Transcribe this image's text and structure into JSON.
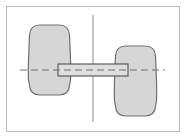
{
  "figure": {
    "title": "Two-mass rotor on a shaft, elevation view",
    "type": "technical-line-diagram",
    "background_color": "#ffffff",
    "frame": {
      "name": "figure-border",
      "stroke_color": "#b9b9b9",
      "stroke_width": 1,
      "x": 6,
      "y": 6,
      "width": 174,
      "height": 126
    },
    "style": {
      "body_fill_color": "#d6d6d6",
      "body_stroke_color": "#6e6e6e",
      "body_stroke_width": 1.2,
      "shaft_fill_color": "#dedede",
      "shaft_stroke_color": "#5c5c5c",
      "shaft_stroke_width": 1.2,
      "centerline_color": "#6e6e6e",
      "axis_line_color": "#8a8a8a",
      "dash_pattern": "7 4"
    },
    "shapes": [
      {
        "name": "left-mass-body",
        "kind": "rounded-barrel",
        "x": 30,
        "y": 25,
        "width": 39,
        "height": 70,
        "corner_radius": 10,
        "bulge": 4,
        "fill": "#d6d6d6",
        "stroke": "#6e6e6e"
      },
      {
        "name": "right-mass-body",
        "kind": "rounded-barrel",
        "x": 116,
        "y": 46,
        "width": 39,
        "height": 70,
        "corner_radius": 10,
        "bulge": 4,
        "fill": "#d6d6d6",
        "stroke": "#6e6e6e"
      },
      {
        "name": "connecting-shaft",
        "kind": "rectangle",
        "x": 58,
        "y": 64,
        "width": 70,
        "height": 12,
        "fill": "#dedede",
        "stroke": "#5c5c5c"
      }
    ],
    "lines": [
      {
        "name": "vertical-centerline",
        "orientation": "vertical",
        "x": 93,
        "y1": 15,
        "y2": 122,
        "color": "#8a8a8a",
        "style": "solid",
        "width": 1
      },
      {
        "name": "horizontal-axis-dashed-line",
        "orientation": "horizontal",
        "y": 70,
        "x1": 20,
        "x2": 165,
        "color": "#6e6e6e",
        "style": "dashed",
        "dash": "7 4",
        "width": 1.2
      }
    ]
  }
}
